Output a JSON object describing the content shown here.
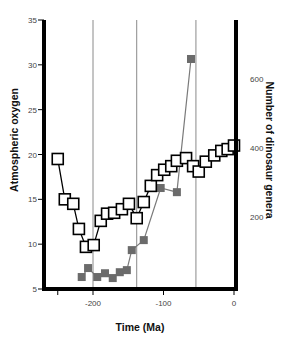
{
  "chart_data": {
    "type": "line",
    "title": "",
    "xlabel": "Time (Ma)",
    "ylabel": "Atmospheric oxygen",
    "ylabel_right": "Number of dinosaur genera",
    "xlim": [
      -265,
      0
    ],
    "ylim": [
      5,
      35
    ],
    "ylim_right": [
      -12,
      780
    ],
    "x_ticks": [
      -250,
      -200,
      -100,
      0
    ],
    "x_tick_labels": [
      "",
      "-200",
      "-100",
      "0"
    ],
    "y_ticks": [
      5,
      10,
      15,
      20,
      25,
      30,
      35
    ],
    "y_tick_labels": [
      "5",
      "10",
      "15",
      "20",
      "25",
      "30",
      "35"
    ],
    "y_right_ticks": [
      200,
      400,
      600
    ],
    "y_right_tick_labels": [
      "200",
      "400",
      "600"
    ],
    "vertical_reference_lines": [
      -200,
      -138,
      -54
    ],
    "grid": false,
    "legend": null,
    "series": [
      {
        "name": "Atmospheric oxygen",
        "axis": "left",
        "marker": "open-square",
        "color": "#000000",
        "x": [
          -250,
          -240,
          -228,
          -220,
          -210,
          -199,
          -189,
          -180,
          -170,
          -159,
          -149,
          -138,
          -128,
          -118,
          -109,
          -99,
          -89,
          -81,
          -68,
          -58,
          -50,
          -40,
          -28,
          -18,
          -9,
          0
        ],
        "values": [
          19.5,
          15.0,
          14.5,
          11.7,
          9.7,
          9.9,
          12.6,
          13.4,
          13.5,
          13.9,
          14.5,
          12.9,
          14.7,
          16.5,
          17.7,
          18.3,
          18.7,
          19.3,
          19.6,
          18.7,
          18.1,
          19.2,
          19.9,
          20.4,
          20.6,
          21.0
        ]
      },
      {
        "name": "Number of dinosaur genera",
        "axis": "right",
        "marker": "filled-square",
        "color": "#6b6b6b",
        "x": [
          -216,
          -207,
          -194,
          -183,
          -172,
          -162,
          -152,
          -145,
          -128,
          -104,
          -81,
          -61
        ],
        "values": [
          26,
          52,
          26,
          37,
          23,
          40,
          46,
          104,
          133,
          284,
          272,
          658
        ]
      }
    ]
  }
}
